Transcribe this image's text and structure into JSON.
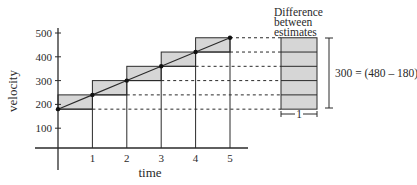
{
  "chart_data": {
    "type": "line",
    "title": "",
    "xlabel": "time",
    "ylabel": "velocity",
    "x": [
      0,
      1,
      2,
      3,
      4,
      5
    ],
    "series": [
      {
        "name": "velocity",
        "values": [
          180,
          240,
          300,
          360,
          420,
          480
        ]
      }
    ],
    "x_ticks": [
      "1",
      "2",
      "3",
      "4",
      "5"
    ],
    "y_ticks": [
      "100",
      "200",
      "300",
      "400",
      "500"
    ],
    "y_tick_values": [
      100,
      200,
      300,
      400,
      500
    ],
    "x_tick_values": [
      1,
      2,
      3,
      4,
      5
    ],
    "xlim": [
      0,
      5
    ],
    "ylim": [
      0,
      500
    ],
    "grid": false,
    "shading": "upper and lower rectangle estimates, difference shaded",
    "difference_stack_steps": 5,
    "annotations": {
      "difference_title": [
        "Difference",
        "between",
        "estimates"
      ],
      "difference_equation": "300 = (480 – 180)",
      "width_label": "1"
    }
  },
  "colors": {
    "ink": "#2a2a2a",
    "shade": "#d6d6d6"
  }
}
